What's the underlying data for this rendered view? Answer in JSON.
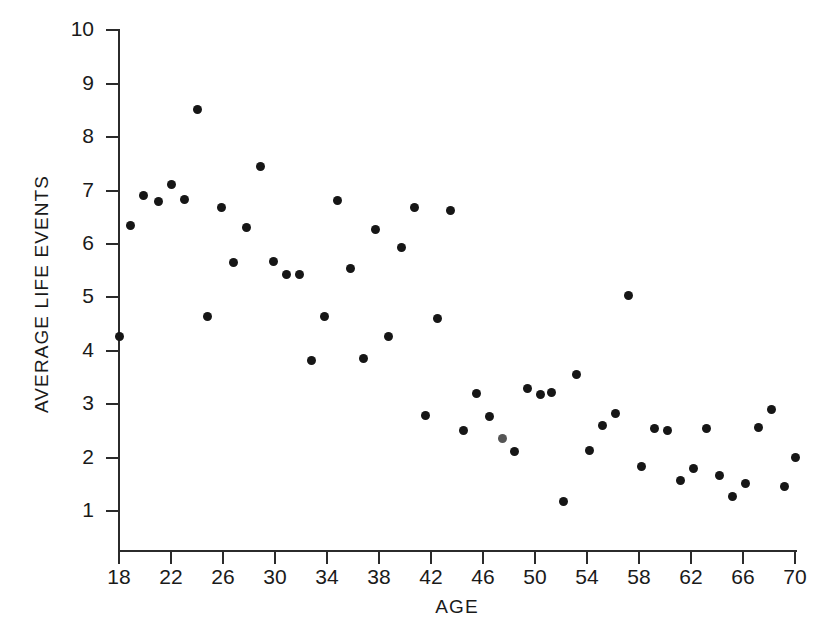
{
  "chart_data": {
    "type": "scatter",
    "title": "",
    "xlabel": "AGE",
    "ylabel": "AVERAGE LIFE EVENTS",
    "xlim": [
      16,
      71
    ],
    "ylim": [
      0,
      10
    ],
    "xticks": [
      18,
      22,
      26,
      30,
      34,
      38,
      42,
      46,
      50,
      54,
      58,
      62,
      66,
      70
    ],
    "yticks": [
      1,
      2,
      3,
      4,
      5,
      6,
      7,
      8,
      9,
      10
    ],
    "grid": false,
    "legend": null,
    "marker_color": "#161616",
    "axis_color": "#2b2b2b",
    "background": "#ffffff",
    "x": [
      18.0,
      18.9,
      19.9,
      21.0,
      22.0,
      23.0,
      24.0,
      24.8,
      25.9,
      26.8,
      27.8,
      28.9,
      29.9,
      30.9,
      31.9,
      32.8,
      33.8,
      34.8,
      35.8,
      36.8,
      37.7,
      38.7,
      39.7,
      40.7,
      41.6,
      42.5,
      43.5,
      44.5,
      45.5,
      46.5,
      47.5,
      48.4,
      49.4,
      50.4,
      51.3,
      52.2,
      53.2,
      54.2,
      55.2,
      56.2,
      57.2,
      58.2,
      59.2,
      60.2,
      61.2,
      62.2,
      63.2,
      64.2,
      65.2,
      66.2,
      67.2,
      68.2,
      69.2,
      70.0
    ],
    "y": [
      4.27,
      6.35,
      6.9,
      6.8,
      7.12,
      6.83,
      8.52,
      4.65,
      6.68,
      5.65,
      6.31,
      7.46,
      5.67,
      5.42,
      5.43,
      3.82,
      4.65,
      6.81,
      5.55,
      3.85,
      6.28,
      4.27,
      5.93,
      6.68,
      2.78,
      4.61,
      6.62,
      2.51,
      3.2,
      2.77,
      2.35,
      2.12,
      3.3,
      3.18,
      3.22,
      1.18,
      3.56,
      2.13,
      2.61,
      2.83,
      5.04,
      1.83,
      2.55,
      2.51,
      1.58,
      1.79,
      2.55,
      1.67,
      1.28,
      1.52,
      2.57,
      2.9,
      1.46,
      2.01
    ],
    "faded_indices": [
      30
    ]
  },
  "caption": ""
}
